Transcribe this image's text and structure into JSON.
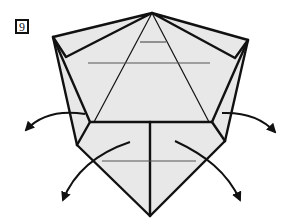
{
  "step": {
    "number": "9"
  },
  "diagram": {
    "paper_color": "#e8e8e8",
    "line_color": "#111111",
    "crease_color": "#555555",
    "arrows": [
      {
        "name": "arrow-upper-left",
        "direction": "down-left"
      },
      {
        "name": "arrow-upper-right",
        "direction": "down-right"
      },
      {
        "name": "arrow-lower-left",
        "direction": "down-left"
      },
      {
        "name": "arrow-lower-right",
        "direction": "down-right"
      }
    ]
  }
}
